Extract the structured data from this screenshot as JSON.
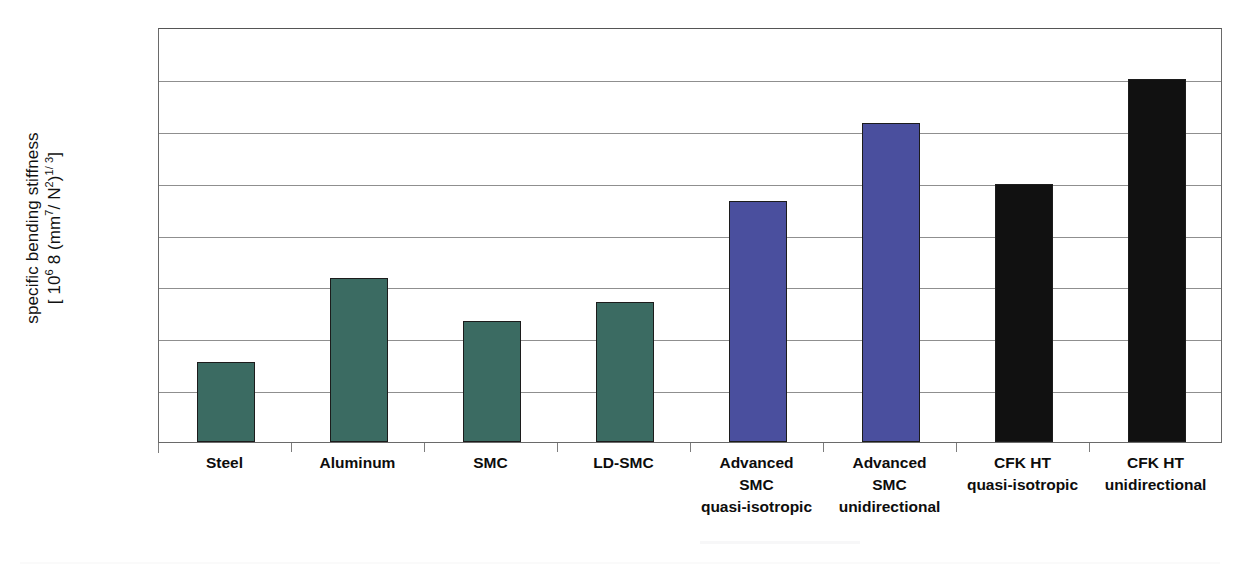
{
  "chart_data": {
    "type": "bar",
    "title": "",
    "xlabel": "",
    "ylabel_line1": "specific bending stiffness",
    "ylabel_line2_prefix": "[ 10",
    "ylabel_line2_sup1": "6",
    "ylabel_line2_mid": " 8 (mm",
    "ylabel_line2_sup2": "7",
    "ylabel_line2_mid2": "/ N",
    "ylabel_line2_sup3": "2",
    "ylabel_line2_mid3": ")",
    "ylabel_line2_sup4": "1/ 3",
    "ylabel_line2_suffix": "]",
    "categories": [
      "Steel",
      "Aluminum",
      "SMC",
      "LD-SMC",
      "Advanced SMC quasi-isotropic",
      "Advanced SMC unidirectional",
      "CFK HT quasi-isotropic",
      "CFK HT unidirectional"
    ],
    "category_label_lines": [
      [
        "Steel"
      ],
      [
        "Aluminum"
      ],
      [
        "SMC"
      ],
      [
        "LD-SMC"
      ],
      [
        "Advanced",
        "SMC",
        "quasi-isotropic"
      ],
      [
        "Advanced",
        "SMC",
        "unidirectional"
      ],
      [
        "CFK HT",
        "quasi-isotropic"
      ],
      [
        "CFK HT",
        "unidirectional"
      ]
    ],
    "values": [
      1.55,
      3.17,
      2.33,
      2.7,
      4.65,
      6.15,
      4.97,
      7.0
    ],
    "ylim": [
      0,
      8
    ],
    "y_gridline_values": [
      1,
      2,
      3,
      4,
      5,
      6,
      7,
      8
    ],
    "y_tick_labels": [],
    "grid": "horizontal",
    "legend": "none",
    "bar_colors": [
      "#3b6b62",
      "#3b6b62",
      "#3b6b62",
      "#3b6b62",
      "#4a4f9e",
      "#4a4f9e",
      "#111111",
      "#111111"
    ],
    "series_groups": [
      {
        "name": "metals",
        "color": "#3b6b62",
        "categories": [
          "Steel",
          "Aluminum",
          "SMC",
          "LD-SMC"
        ]
      },
      {
        "name": "advanced-smc",
        "color": "#4a4f9e",
        "categories": [
          "Advanced SMC quasi-isotropic",
          "Advanced SMC unidirectional"
        ]
      },
      {
        "name": "cfk-ht",
        "color": "#111111",
        "categories": [
          "CFK HT quasi-isotropic",
          "CFK HT unidirectional"
        ]
      }
    ]
  },
  "colors": {
    "teal": "#3b6b62",
    "purple": "#4a4f9e",
    "black": "#111111",
    "gridline": "#8f8f8f",
    "frame": "#6a6a6a",
    "background": "#ffffff"
  }
}
